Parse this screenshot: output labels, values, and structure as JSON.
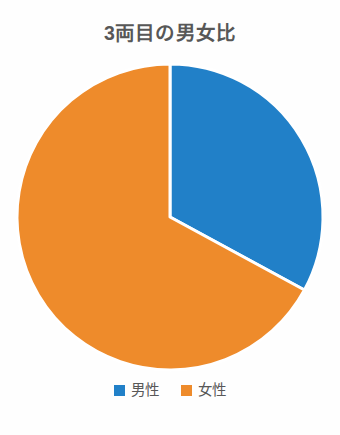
{
  "chart_data": {
    "type": "pie",
    "title": "3両目の男女比",
    "categories": [
      "男性",
      "女性"
    ],
    "values": [
      33,
      67
    ],
    "unit": "%",
    "colors": [
      "#2180c8",
      "#ee8b2b"
    ],
    "legend_position": "bottom",
    "start_angle_deg": 0,
    "direction": "clockwise",
    "slice_separator_color": "#ffffff",
    "background_color": "#fefefe",
    "title_color": "#575757",
    "label_color": "#585858",
    "grid": false,
    "xlabel": "",
    "ylabel": "",
    "data_labels_shown": false,
    "slices": [
      {
        "label": "男性",
        "value": 33,
        "color": "#2180c8",
        "start_deg": 0,
        "end_deg": 118.5
      },
      {
        "label": "女性",
        "value": 67,
        "color": "#ee8b2b",
        "start_deg": 118.5,
        "end_deg": 360
      }
    ]
  },
  "legend": {
    "items": [
      {
        "label": "男性",
        "color": "#2180c8",
        "swatch_name": "legend-swatch-male"
      },
      {
        "label": "女性",
        "color": "#ee8b2b",
        "swatch_name": "legend-swatch-female"
      }
    ]
  },
  "geometry": {
    "center_x": 170,
    "center_y": 162,
    "radius": 153
  }
}
